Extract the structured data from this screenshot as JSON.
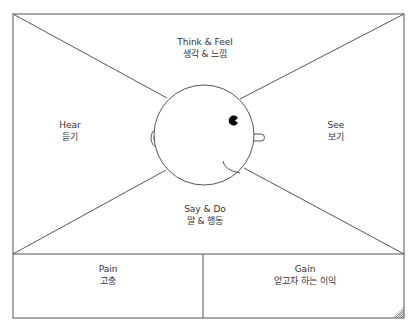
{
  "diagram": {
    "type": "empathy-map",
    "colors": {
      "stroke": "#555555",
      "text": "#333333",
      "eye": "#000000",
      "background": "#ffffff"
    },
    "sections": {
      "think_feel": {
        "en": "Think & Feel",
        "ko": "생각 & 느낌"
      },
      "hear": {
        "en": "Hear",
        "ko": "듣기"
      },
      "see": {
        "en": "See",
        "ko": "보기"
      },
      "say_do": {
        "en": "Say & Do",
        "ko": "말 & 행동"
      },
      "pain": {
        "en": "Pain",
        "ko": "고충"
      },
      "gain": {
        "en": "Gain",
        "ko": "얻고자 하는 이익"
      }
    }
  }
}
